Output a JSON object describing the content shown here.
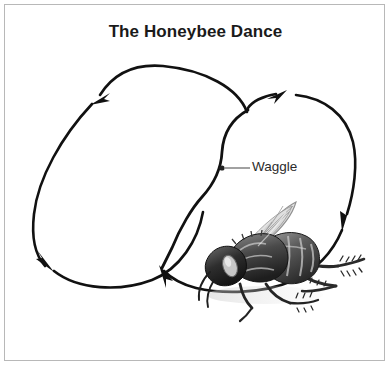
{
  "figure": {
    "title": "The Honeybee Dance",
    "background_color": "#ffffff",
    "border_color": "#b8b8b8",
    "stroke_color": "#111111",
    "label_color": "#2b2b2b"
  },
  "annotations": {
    "waggle": {
      "label": "Waggle",
      "leader_dot_x": 222,
      "leader_dot_y": 168,
      "leader_line_end_x": 250,
      "leader_line_end_y": 168
    }
  },
  "diagram_data": {
    "type": "diagram",
    "subject": "honeybee waggle dance figure-eight path",
    "elements": [
      {
        "name": "left-loop",
        "description": "large counter-clockwise oval loop on the left side of the figure eight",
        "arrowheads": [
          {
            "name": "left-loop-top-arrow",
            "x": 97,
            "y": 98,
            "direction": "down-left"
          },
          {
            "name": "left-loop-bottom-arrow",
            "x": 48,
            "y": 265,
            "direction": "down-right"
          }
        ]
      },
      {
        "name": "right-loop",
        "description": "clockwise loop on the right side of the figure eight",
        "arrowheads": [
          {
            "name": "right-loop-top-arrow",
            "x": 282,
            "y": 93,
            "direction": "up-right"
          },
          {
            "name": "right-loop-side-arrow",
            "x": 345,
            "y": 222,
            "direction": "down-left"
          }
        ]
      },
      {
        "name": "waggle-run",
        "description": "central S-shaped straight run where the bee waggles, joining the two loops",
        "arrowheads": [
          {
            "name": "waggle-run-bottom-arrow",
            "x": 160,
            "y": 272,
            "direction": "up-left"
          }
        ]
      },
      {
        "name": "honeybee-illustration",
        "description": "grayscale honeybee drawing facing left with raised translucent wings and striped abdomen",
        "x": 196,
        "y": 196,
        "width": 160,
        "height": 120
      }
    ]
  }
}
